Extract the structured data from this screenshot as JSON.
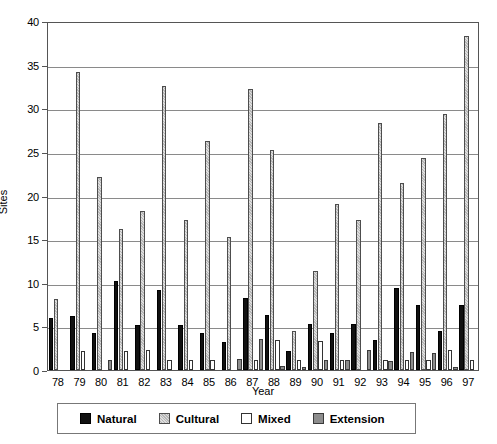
{
  "chart_data": {
    "type": "bar",
    "title": "",
    "xlabel": "Year",
    "ylabel": "Sites",
    "ylim": [
      0,
      40
    ],
    "yticks": [
      0,
      5,
      10,
      15,
      20,
      25,
      30,
      35,
      40
    ],
    "grid": true,
    "legend_position": "bottom",
    "categories": [
      "78",
      "79",
      "80",
      "81",
      "82",
      "83",
      "84",
      "85",
      "86",
      "87",
      "88",
      "89",
      "90",
      "91",
      "92",
      "93",
      "94",
      "95",
      "96",
      "97"
    ],
    "series": [
      {
        "name": "Natural",
        "color": "#111111",
        "values": [
          6.0,
          6.2,
          4.2,
          10.2,
          5.2,
          9.2,
          5.2,
          4.2,
          3.2,
          8.3,
          6.3,
          2.2,
          5.3,
          4.2,
          5.3,
          3.4,
          9.4,
          7.4,
          4.5,
          7.5
        ]
      },
      {
        "name": "Cultural",
        "color": "#b6b6b6",
        "values": [
          8.1,
          34.2,
          22.1,
          16.2,
          18.2,
          32.6,
          17.2,
          26.2,
          15.2,
          32.2,
          25.2,
          4.5,
          11.3,
          19.0,
          17.2,
          28.3,
          21.4,
          24.3,
          29.3,
          38.3
        ]
      },
      {
        "name": "Mixed",
        "color": "#ffffff",
        "values": [
          0.0,
          2.2,
          0.0,
          2.2,
          2.3,
          1.2,
          1.2,
          1.2,
          0.0,
          1.1,
          3.4,
          1.1,
          3.3,
          1.1,
          0.0,
          1.1,
          1.2,
          1.2,
          2.3,
          1.2
        ]
      },
      {
        "name": "Extension",
        "color": "#8d8d8d",
        "values": [
          0.0,
          0.0,
          1.2,
          0.0,
          0.0,
          0.0,
          0.0,
          0.0,
          1.3,
          3.5,
          0.5,
          0.3,
          1.2,
          1.1,
          2.3,
          1.0,
          2.1,
          2.0,
          0.4,
          0.0
        ]
      }
    ]
  },
  "legend": {
    "items": [
      {
        "label": "Natural",
        "key": "natural"
      },
      {
        "label": "Cultural",
        "key": "cultural"
      },
      {
        "label": "Mixed",
        "key": "mixed"
      },
      {
        "label": "Extension",
        "key": "extension"
      }
    ]
  }
}
